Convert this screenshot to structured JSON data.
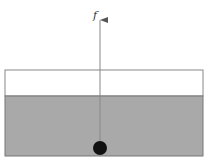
{
  "diagram": {
    "force_label": "f",
    "colors": {
      "liquid": "#a9a9a9",
      "container_border": "#777777",
      "ball": "#111111",
      "arrow": "#777777",
      "background": "#ffffff"
    },
    "elements": {
      "container": {
        "x": 5,
        "y": 70,
        "width": 198,
        "height": 86
      },
      "liquid_surface_y": 96,
      "ball": {
        "cx": 100,
        "cy": 148,
        "r": 7
      },
      "arrow": {
        "x": 100,
        "y_start": 141,
        "y_end": 20
      }
    }
  }
}
